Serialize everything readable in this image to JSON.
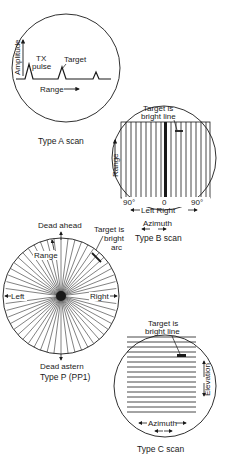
{
  "type_a": {
    "caption": "Type A scan",
    "y_axis": "Amplitude",
    "x_axis": "Range",
    "tx_line1": "TX",
    "tx_line2": "pulse",
    "target": "Target"
  },
  "type_b": {
    "caption": "Type B scan",
    "target_line1": "Target is",
    "target_line2": "bright line",
    "y_axis": "Range",
    "left_deg": "90°",
    "center_deg": "0",
    "right_deg": "90°",
    "left_right": "Left Right",
    "azimuth": "Azimuth"
  },
  "type_p": {
    "caption": "Type P (PP1)",
    "dead_ahead": "Dead ahead",
    "dead_astern": "Dead astern",
    "range": "Range",
    "left": "Left",
    "right": "Right",
    "target_line1": "Target is",
    "target_line2": "bright",
    "target_line3": "arc"
  },
  "type_c": {
    "caption": "Type C scan",
    "target_line1": "Target is",
    "target_line2": "bright line",
    "elevation": "Elevation",
    "azimuth": "Azimuth"
  }
}
